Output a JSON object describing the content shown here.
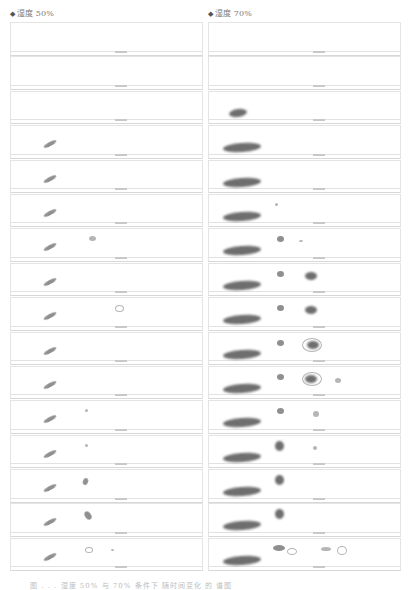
{
  "figure": {
    "columns": [
      {
        "label": "湿度 50%",
        "marker": "◆",
        "panel_count": 16
      },
      {
        "label": "湿度 70%",
        "marker": "◆",
        "panel_count": 16
      }
    ],
    "caption": "图 . . . 湿度 50% 与 70% 条件下 随时间变化 的 谱图",
    "colors": {
      "spot_dark": "#6e6e6e",
      "spot_mid": "#8f8f8f",
      "spot_light": "#b5b5b5",
      "frame": "#e4e4e4"
    }
  }
}
